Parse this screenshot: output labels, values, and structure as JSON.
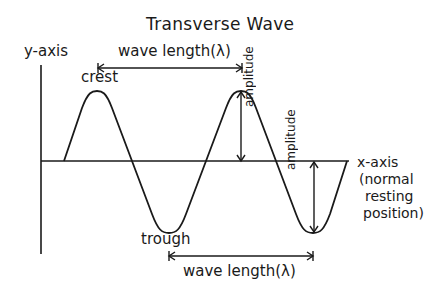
{
  "diagram": {
    "title": "Transverse Wave",
    "y_axis_label": "y-axis",
    "x_axis_label_lines": [
      "x-axis",
      "(normal",
      "resting",
      "position)"
    ],
    "crest_label": "crest",
    "trough_label": "trough",
    "amplitude_label": "amplitude",
    "amplitude_label_2": "amplitude",
    "wavelength_top_label": "wave length(λ)",
    "wavelength_bottom_label": "wave length(λ)",
    "colors": {
      "ink": "#1a1a1a",
      "background": "#ffffff"
    }
  }
}
